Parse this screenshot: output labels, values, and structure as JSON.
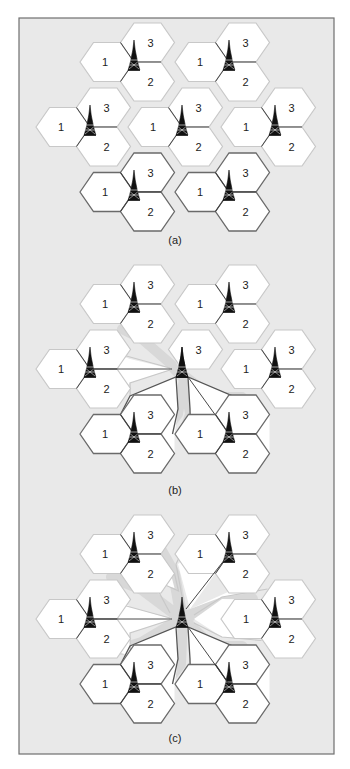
{
  "figure": {
    "background": "#e9e9e9",
    "frame_color": "#6f6f6f",
    "hex_fill": "#ffffff",
    "hex_stroke_light": "#c8c8c8",
    "hex_stroke_dark": "#6a6a6a",
    "sector_labels": [
      "1",
      "2",
      "3"
    ],
    "icon": "cell-tower-icon"
  },
  "panels": [
    {
      "id": "a",
      "caption": "(a)",
      "description": "Seven three-sector cell sites, each a cluster of hexagonal sectors 1, 2, 3 around a tower",
      "sites": [
        {
          "name": "top-left",
          "sectors": [
            "1",
            "3",
            "2"
          ]
        },
        {
          "name": "top-right",
          "sectors": [
            "1",
            "3",
            "2"
          ]
        },
        {
          "name": "middle-left",
          "sectors": [
            "1",
            "3",
            "2"
          ]
        },
        {
          "name": "middle-center",
          "sectors": [
            "1",
            "3",
            "2"
          ]
        },
        {
          "name": "middle-right",
          "sectors": [
            "1",
            "3",
            "2"
          ]
        },
        {
          "name": "bottom-left",
          "sectors": [
            "1",
            "3",
            "2"
          ],
          "highlighted": true
        },
        {
          "name": "bottom-right",
          "sectors": [
            "1",
            "3",
            "2"
          ],
          "highlighted": true
        }
      ]
    },
    {
      "id": "b",
      "caption": "(b)",
      "description": "Center site reduced to sector 3; its former sectors 1 and 2 coverage absorbed by neighboring sites via extended sectors",
      "sites": [
        {
          "name": "top-left",
          "sectors": [
            "1",
            "3",
            "2"
          ]
        },
        {
          "name": "top-right",
          "sectors": [
            "1",
            "3",
            "2"
          ]
        },
        {
          "name": "middle-left",
          "sectors": [
            "1",
            "3",
            "2"
          ],
          "extended": true
        },
        {
          "name": "middle-center",
          "sectors": [
            "3"
          ]
        },
        {
          "name": "middle-right",
          "sectors": [
            "1",
            "3",
            "2"
          ]
        },
        {
          "name": "bottom-left",
          "sectors": [
            "1",
            "3",
            "2"
          ],
          "extended": true
        },
        {
          "name": "bottom-right",
          "sectors": [
            "1",
            "3",
            "2"
          ],
          "extended": true
        }
      ]
    },
    {
      "id": "c",
      "caption": "(c)",
      "description": "Center site fully removed; all six neighboring sites extend sectors toward the center tower location",
      "sites": [
        {
          "name": "top-left",
          "sectors": [
            "1",
            "3",
            "2"
          ],
          "extended": true
        },
        {
          "name": "top-right",
          "sectors": [
            "1",
            "3",
            "2"
          ],
          "extended": true
        },
        {
          "name": "middle-left",
          "sectors": [
            "1",
            "3",
            "2"
          ],
          "extended": true
        },
        {
          "name": "middle-center",
          "sectors": []
        },
        {
          "name": "middle-right",
          "sectors": [
            "1",
            "3",
            "2"
          ],
          "extended": true
        },
        {
          "name": "bottom-left",
          "sectors": [
            "1",
            "3",
            "2"
          ],
          "extended": true
        },
        {
          "name": "bottom-right",
          "sectors": [
            "1",
            "3",
            "2"
          ],
          "extended": true
        }
      ]
    }
  ]
}
